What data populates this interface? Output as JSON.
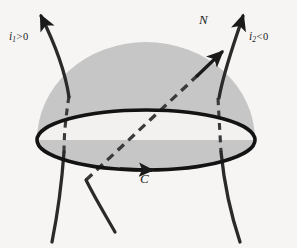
{
  "figure": {
    "background_color": "#f6f5f3",
    "ink_color": "#1a1a1a",
    "dome_fill_color": "#c6c6c6",
    "disk_fill_color": "#f2f1ef",
    "labels": {
      "current_left": {
        "symbol": "i",
        "subscript": "1",
        "relation": ">",
        "value": "0",
        "text": "i1 > 0"
      },
      "current_right": {
        "symbol": "i",
        "subscript": "2",
        "relation": "<",
        "value": "0",
        "text": "i2 < 0"
      },
      "normal": {
        "text": "N"
      },
      "curve": {
        "text": "C"
      }
    },
    "elements": {
      "surface_name": "hemispherical-cap-surface",
      "boundary_name": "boundary-circle-C",
      "normal_vector_name": "normal-vector-N",
      "left_wire_name": "current-wire-i1",
      "right_wire_name": "current-wire-i2"
    }
  }
}
